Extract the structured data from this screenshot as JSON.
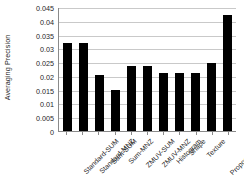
{
  "chart_data": {
    "type": "bar",
    "title": "",
    "subtitle": "",
    "xlabel": "",
    "ylabel": "Averaging Precision",
    "ylim": [
      0,
      0.045
    ],
    "yticks": [
      0,
      0.005,
      0.01,
      0.015,
      0.02,
      0.025,
      0.03,
      0.035,
      0.04,
      0.045
    ],
    "ytick_labels": [
      "0",
      "0.005",
      "0.01",
      "0.015",
      "0.02",
      "0.025",
      "0.03",
      "0.035",
      "0.04",
      "0.045"
    ],
    "grid": true,
    "grid_axis": "y",
    "legend": false,
    "legend_position": "none",
    "bar_color": "#000000",
    "gridline_color": "#c9c9c9",
    "axis_color": "#8a8a8a",
    "background_color": "#ffffff",
    "xtick_label_rotation": 45,
    "categories": [
      "Standard-SUM",
      "Standard-MNZ",
      "Sum-SUM",
      "Sum-MNZ",
      "ZMUV-SUM",
      "ZMUV-MNZ",
      "Histogram",
      "Shape",
      "Texture",
      "Proposed-SUM",
      "Proposed-MNZ"
    ],
    "values": [
      0.0319,
      0.0319,
      0.0205,
      0.015,
      0.0236,
      0.0236,
      0.0212,
      0.0212,
      0.0212,
      0.0248,
      0.0422
    ]
  }
}
